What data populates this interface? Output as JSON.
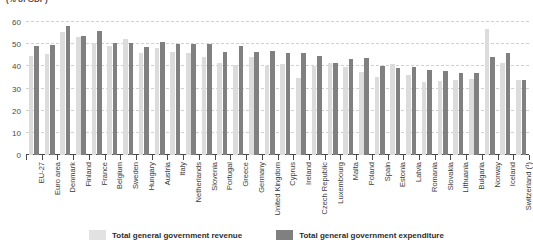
{
  "chart": {
    "subtitle": "(% of GDP)"
  },
  "legend": {
    "position": "bottom-center",
    "items": [
      {
        "key": "revenue",
        "label": "Total general government revenue",
        "color": "#dcdcdc"
      },
      {
        "key": "expenditure",
        "label": "Total general government expenditure",
        "color": "#808080"
      }
    ]
  },
  "chart_data": {
    "type": "bar",
    "title": "",
    "subtitle": "(% of GDP)",
    "xlabel": "",
    "ylabel": "",
    "ylim": [
      0,
      60
    ],
    "yticks": [
      0,
      10,
      20,
      30,
      40,
      50,
      60
    ],
    "grid": true,
    "legend_position": "bottom-center",
    "categories": [
      "EU-27",
      "Euro area",
      "Denmark",
      "Finland",
      "France",
      "Belgium",
      "Sweden",
      "Hungary",
      "Austria",
      "Italy",
      "Netherlands",
      "Slovenia",
      "Portugal",
      "Greece",
      "Germany",
      "United Kingdom",
      "Cyprus",
      "Ireland",
      "Czech Republic",
      "Luxembourg",
      "Malta",
      "Poland",
      "Spain",
      "Estonia",
      "Latvia",
      "Romania",
      "Slovakia",
      "Lithuania",
      "Bulgaria",
      "Norway",
      "Iceland",
      "Switzerland (¹)"
    ],
    "series": [
      {
        "name": "Total general government revenue",
        "color": "#dcdcdc",
        "values": [
          44.6,
          45.4,
          55.5,
          53.2,
          50.4,
          49.1,
          52.2,
          46.2,
          48.4,
          46.6,
          45.9,
          44.3,
          41.5,
          40.6,
          44.3,
          40.3,
          40.9,
          34.6,
          40.3,
          41.4,
          39.8,
          37.5,
          35.1,
          40.9,
          36.2,
          33.1,
          33.5,
          34.0,
          34.1,
          56.8,
          41.6,
          33.8
        ]
      },
      {
        "name": "Total general government expenditure",
        "color": "#808080",
        "values": [
          49.2,
          49.6,
          58.3,
          53.9,
          55.9,
          50.6,
          50.6,
          48.9,
          51.1,
          50.1,
          50.3,
          50.0,
          46.4,
          49.3,
          46.4,
          47.0,
          46.2,
          46.0,
          44.6,
          41.3,
          43.1,
          43.8,
          40.2,
          39.3,
          39.5,
          38.5,
          38.1,
          37.2,
          37.1,
          44.0,
          45.9,
          33.8
        ]
      }
    ]
  }
}
